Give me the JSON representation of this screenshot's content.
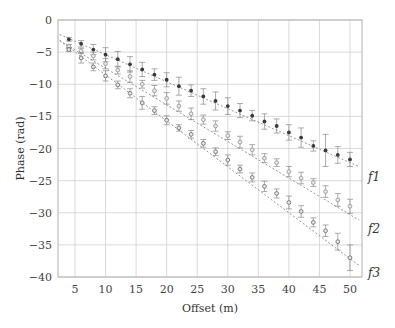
{
  "chart_data": {
    "type": "scatter",
    "title": "",
    "xlabel": "Offset (m)",
    "ylabel": "Phase (rad)",
    "xlim": [
      2.5,
      52
    ],
    "ylim": [
      -40,
      0
    ],
    "xticks": [
      5,
      10,
      15,
      20,
      25,
      30,
      35,
      40,
      45,
      50
    ],
    "yticks": [
      0,
      -5,
      -10,
      -15,
      -20,
      -25,
      -30,
      -35,
      -40
    ],
    "grid": true,
    "legend": "inline labels at right end of each fit line",
    "x": [
      4,
      6,
      8,
      10,
      12,
      14,
      16,
      18,
      20,
      22,
      24,
      26,
      28,
      30,
      32,
      34,
      36,
      38,
      40,
      42,
      44,
      46,
      48,
      50
    ],
    "series": [
      {
        "name": "f1",
        "marker": "filled dark circle with error bars",
        "values": [
          -3.0,
          -3.7,
          -4.6,
          -5.4,
          -6.1,
          -6.9,
          -7.7,
          -8.5,
          -9.3,
          -10.3,
          -11.0,
          -11.9,
          -12.6,
          -13.4,
          -14.1,
          -14.9,
          -15.8,
          -16.5,
          -17.5,
          -18.3,
          -19.6,
          -20.3,
          -21.0,
          -21.7
        ],
        "errors": [
          0.3,
          0.5,
          0.8,
          1.1,
          1.2,
          1.2,
          1.1,
          0.9,
          1.1,
          1.4,
          0.9,
          1.2,
          1.4,
          1.3,
          1.1,
          0.8,
          1.2,
          1.1,
          1.2,
          1.5,
          0.8,
          2.5,
          1.3,
          1.1
        ],
        "fit_line": {
          "slope": -0.42,
          "intercept": -1.2
        }
      },
      {
        "name": "f2",
        "marker": "open light circle with error bars",
        "values": [
          -4.1,
          -4.8,
          -5.6,
          -6.8,
          -7.8,
          -8.8,
          -10.0,
          -11.0,
          -12.2,
          -13.4,
          -14.6,
          -15.5,
          -16.5,
          -18.0,
          -19.0,
          -20.2,
          -21.5,
          -22.2,
          -23.6,
          -24.6,
          -25.3,
          -26.7,
          -28.0,
          -29.0
        ],
        "errors": [
          0.3,
          0.4,
          0.6,
          0.8,
          0.6,
          0.9,
          0.6,
          0.8,
          0.9,
          0.8,
          0.9,
          0.7,
          0.8,
          0.6,
          0.9,
          0.8,
          0.7,
          0.6,
          0.8,
          0.9,
          0.6,
          0.9,
          1.0,
          1.1
        ],
        "fit_line": {
          "slope": -0.57,
          "intercept": -1.8
        }
      },
      {
        "name": "f3",
        "marker": "open circle with error bars",
        "values": [
          -4.6,
          -5.9,
          -7.3,
          -8.7,
          -10.1,
          -11.4,
          -12.9,
          -14.1,
          -15.6,
          -16.8,
          -17.8,
          -19.2,
          -20.5,
          -21.8,
          -23.2,
          -24.5,
          -25.9,
          -27.0,
          -28.4,
          -29.8,
          -31.5,
          -32.8,
          -34.5,
          -37.0
        ],
        "errors": [
          0.3,
          0.8,
          0.6,
          0.8,
          0.6,
          0.7,
          1.0,
          0.6,
          0.7,
          0.5,
          0.6,
          0.6,
          0.6,
          0.8,
          0.6,
          0.7,
          0.8,
          0.7,
          1.0,
          0.9,
          0.7,
          0.9,
          1.3,
          2.0
        ],
        "fit_line": {
          "slope": -0.715,
          "intercept": -1.4
        }
      }
    ]
  },
  "axes": {
    "xlabel": "Offset (m)",
    "ylabel": "Phase (rad)"
  },
  "labels": {
    "f1": "f1",
    "f2": "f2",
    "f3": "f3"
  },
  "colors": {
    "grid": "#d0d0d0",
    "frame": "#b0b0b0",
    "f1": "#3a3a3a",
    "f2": "#9a9a9a",
    "f3": "#707070",
    "fit": "#8a8a8a"
  }
}
